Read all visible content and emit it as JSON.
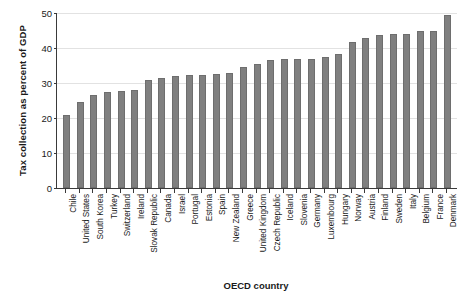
{
  "chart_data": {
    "type": "bar",
    "title": "",
    "xlabel": "OECD country",
    "ylabel": "Tax collection as percent of GDP",
    "ylim": [
      0,
      50
    ],
    "yticks": [
      0,
      10,
      20,
      30,
      40,
      50
    ],
    "grid": true,
    "legend": "none",
    "bar_color": "#808080",
    "bar_edge_color": "#6e6e6e",
    "axis_color": "#3a3a3a",
    "gridline_color": "#e2e2e2",
    "categories": [
      "Chile",
      "United States",
      "South Korea",
      "Turkey",
      "Switzerland",
      "Ireland",
      "Slovak Republic",
      "Canada",
      "Israel",
      "Portugal",
      "Estonia",
      "Spain",
      "New Zealand",
      "Greece",
      "United Kingdom",
      "Czech Republic",
      "Iceland",
      "Slovenia",
      "Germany",
      "Luxembourg",
      "Hungary",
      "Norway",
      "Austria",
      "Finland",
      "Sweden",
      "Italy",
      "Belgium",
      "France",
      "Denmark"
    ],
    "values": [
      21.0,
      24.5,
      26.5,
      27.5,
      27.8,
      28.0,
      31.0,
      31.5,
      32.0,
      32.3,
      32.3,
      32.5,
      33.0,
      34.5,
      35.5,
      36.5,
      36.8,
      37.0,
      37.0,
      37.3,
      38.3,
      41.8,
      43.0,
      43.8,
      44.0,
      44.0,
      44.8,
      44.8,
      49.5
    ]
  }
}
